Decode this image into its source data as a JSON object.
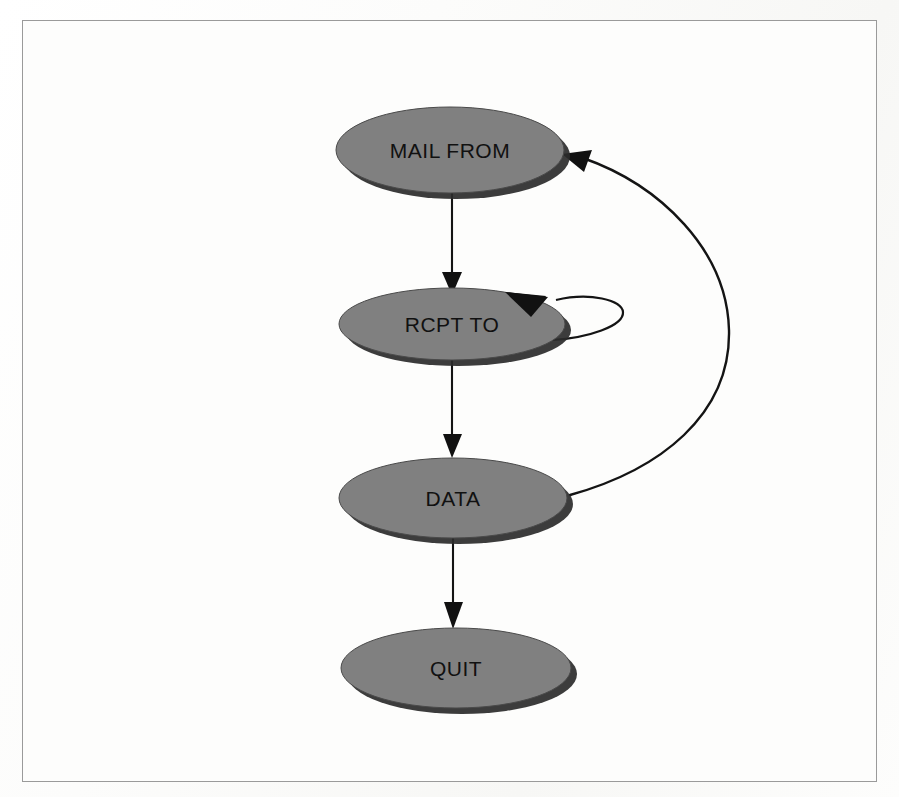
{
  "document": {
    "kind": "state-diagram",
    "caption_text": ""
  },
  "colors": {
    "node_fill": "#808080",
    "node_stroke": "#4a4a4a",
    "node_shadow": "#2b2b2b",
    "edge": "#141414",
    "label_text": "#111111",
    "page_background": "#fdfdfc",
    "frame_border": "#9a9a9a"
  },
  "diagram": {
    "nodes": [
      {
        "id": "mail-from",
        "label": "MAIL FROM",
        "cx": 450,
        "cy": 150,
        "rx": 114,
        "ry": 43
      },
      {
        "id": "rcpt-to",
        "label": "RCPT TO",
        "cx": 452,
        "cy": 324,
        "rx": 113,
        "ry": 36
      },
      {
        "id": "data",
        "label": "DATA",
        "cx": 453,
        "cy": 498,
        "rx": 114,
        "ry": 40
      },
      {
        "id": "quit",
        "label": "QUIT",
        "cx": 456,
        "cy": 668,
        "rx": 115,
        "ry": 40
      }
    ],
    "edges": [
      {
        "id": "mail-from-to-rcpt-to",
        "from": "mail-from",
        "to": "rcpt-to",
        "label": "",
        "kind": "straight-down"
      },
      {
        "id": "rcpt-to-self-loop",
        "from": "rcpt-to",
        "to": "rcpt-to",
        "label": "",
        "kind": "self-loop"
      },
      {
        "id": "rcpt-to-to-data",
        "from": "rcpt-to",
        "to": "data",
        "label": "",
        "kind": "straight-down"
      },
      {
        "id": "data-to-quit",
        "from": "data",
        "to": "quit",
        "label": "",
        "kind": "straight-down"
      },
      {
        "id": "data-to-mail-from",
        "from": "data",
        "to": "mail-from",
        "label": "",
        "kind": "feedback-curve"
      }
    ]
  }
}
